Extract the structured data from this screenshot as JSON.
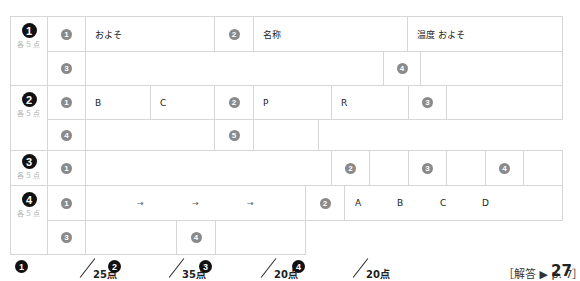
{
  "questions": [
    {
      "number": "1",
      "points_each": "各５点",
      "row1": {
        "n1": "1",
        "t1": "およそ",
        "n2": "2",
        "t2": "名称",
        "t3": "温度 およそ"
      },
      "row2": {
        "n3": "3",
        "n4": "4"
      }
    },
    {
      "number": "2",
      "points_each": "各５点",
      "row1": {
        "n1": "1",
        "b": "B",
        "c": "C",
        "n2": "2",
        "p": "P",
        "r": "R",
        "n3": "3"
      },
      "row2": {
        "n4": "4",
        "n5": "5"
      }
    },
    {
      "number": "3",
      "points_each": "各５点",
      "row1": {
        "n1": "1",
        "n2": "2",
        "n3": "3",
        "n4": "4"
      }
    },
    {
      "number": "4",
      "points_each": "各５点",
      "row1": {
        "n1": "1",
        "arrows": [
          "→",
          "→",
          "→"
        ],
        "n2": "2",
        "letters": [
          "A",
          "B",
          "C",
          "D"
        ]
      },
      "row2": {
        "n3": "3",
        "n4": "4"
      }
    }
  ],
  "scores": [
    {
      "number": "1",
      "max": "25点"
    },
    {
      "number": "2",
      "max": "35点"
    },
    {
      "number": "3",
      "max": "20点"
    },
    {
      "number": "4",
      "max": "20点"
    }
  ],
  "answer_ref": "［解答 ▶ p. 7］",
  "page_number": "27"
}
